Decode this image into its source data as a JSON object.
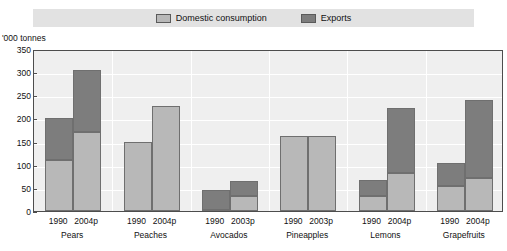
{
  "legend": {
    "entries": [
      {
        "label": "Domestic consumption",
        "swatch_name": "legend-swatch-domestic",
        "color": "#b8b8b8"
      },
      {
        "label": "Exports",
        "swatch_name": "legend-swatch-exports",
        "color": "#7d7d7d"
      }
    ]
  },
  "axis": {
    "y_unit": "'000 tonnes",
    "y_ticks": [
      "0",
      "50",
      "100",
      "150",
      "200",
      "250",
      "300",
      "350"
    ]
  },
  "chart_data": {
    "type": "bar",
    "title": "",
    "subtitle": "",
    "stacked": true,
    "xlabel": "",
    "ylabel": "'000 tonnes",
    "ylim": [
      0,
      350
    ],
    "ytick_step": 50,
    "grid": true,
    "legend_position": "top",
    "groups": [
      {
        "name": "Pears",
        "years": [
          "1990",
          "2004p"
        ]
      },
      {
        "name": "Peaches",
        "years": [
          "1990",
          "2004p"
        ]
      },
      {
        "name": "Avocados",
        "years": [
          "1990",
          "2003p"
        ]
      },
      {
        "name": "Pineapples",
        "years": [
          "1990",
          "2003p"
        ]
      },
      {
        "name": "Lemons",
        "years": [
          "1990",
          "2004p"
        ]
      },
      {
        "name": "Grapefruits",
        "years": [
          "1990",
          "2004p"
        ]
      }
    ],
    "categories": [
      "Pears 1990",
      "Pears 2004p",
      "Peaches 1990",
      "Peaches 2004p",
      "Avocados 1990",
      "Avocados 2003p",
      "Pineapples 1990",
      "Pineapples 2003p",
      "Lemons 1990",
      "Lemons 2004p",
      "Grapefruits 1990",
      "Grapefruits 2004p"
    ],
    "series": [
      {
        "name": "Domestic consumption",
        "color": "#b8b8b8",
        "values": [
          110,
          170,
          150,
          227,
          3,
          33,
          163,
          163,
          33,
          82,
          55,
          72
        ]
      },
      {
        "name": "Exports",
        "color": "#7d7d7d",
        "values": [
          90,
          135,
          0,
          0,
          42,
          32,
          0,
          0,
          34,
          140,
          48,
          168
        ]
      }
    ],
    "totals": [
      200,
      305,
      150,
      227,
      45,
      65,
      163,
      163,
      67,
      222,
      103,
      240
    ]
  },
  "colors": {
    "domestic": "#b8b8b8",
    "exports": "#7d7d7d",
    "plot_background": "#efefef",
    "legend_background": "#e2e2e2",
    "frame": "#4d4d4d",
    "gridline": "#ffffff"
  }
}
